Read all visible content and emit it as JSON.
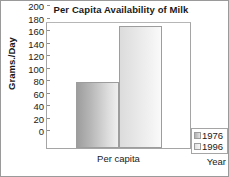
{
  "chart_data": {
    "type": "bar",
    "title": "Per Capita Availability of Milk",
    "xlabel": "",
    "ylabel": "Grams./Day",
    "categories": [
      "Per capita"
    ],
    "series": [
      {
        "name": "1976",
        "values": [
          105
        ]
      },
      {
        "name": "1996",
        "values": [
          196
        ]
      }
    ],
    "ylim": [
      0,
      200
    ],
    "yticks": [
      0,
      20,
      40,
      60,
      80,
      100,
      120,
      140,
      160,
      180,
      200
    ],
    "ytick_labels": [
      "0",
      "20",
      "40",
      "60",
      "80",
      "100",
      "120",
      "140",
      "160",
      "180",
      "200"
    ],
    "grid": false,
    "legend_position": "bottom-right",
    "legend_title": "Year",
    "colors": {
      "series_1976_dark": "#9d9d9d",
      "series_1976_light": "#efefef",
      "series_1996_dark": "#dcdcdc",
      "series_1996_light": "#fafafa",
      "axis": "#a5a5a5",
      "text": "#1a1a1a",
      "frame": "#9a9a9a",
      "background": "#ffffff"
    }
  }
}
